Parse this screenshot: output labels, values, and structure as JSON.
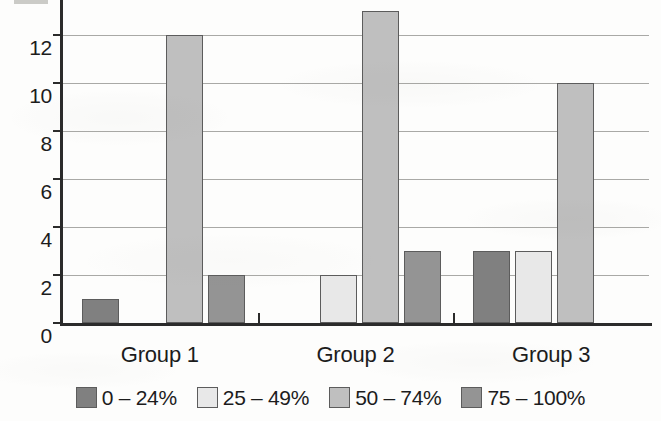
{
  "chart_data": {
    "type": "bar",
    "title": "",
    "subtitle": "",
    "xlabel": "",
    "ylabel": "",
    "categories": [
      "Group 1",
      "Group 2",
      "Group 3"
    ],
    "series": [
      {
        "name": "0 – 24%",
        "values": [
          1,
          0,
          3
        ],
        "color": "#808080"
      },
      {
        "name": "25 – 49%",
        "values": [
          0,
          2,
          3
        ],
        "color": "#e8e8e8"
      },
      {
        "name": "50 – 74%",
        "values": [
          12,
          13,
          10
        ],
        "color": "#bfbfbf"
      },
      {
        "name": "75 – 100%",
        "values": [
          2,
          3,
          0
        ],
        "color": "#949494"
      }
    ],
    "ylim": [
      0,
      14
    ],
    "ytick_values": [
      0,
      2,
      4,
      6,
      8,
      10,
      12,
      14
    ],
    "ytick_labels": [
      "0",
      "2",
      "4",
      "6",
      "8",
      "10",
      "12",
      "14"
    ],
    "ytick_labels_visible": [
      "0",
      "2",
      "4",
      "6",
      "8",
      "10",
      "12"
    ],
    "grid": true,
    "grid_axis": "y",
    "legend_position": "bottom",
    "bar_orientation": "vertical",
    "note_top_cropped": true
  },
  "axis": {
    "y_axis_name": "y-axis",
    "x_axis_name": "x-axis",
    "grid_color": "#9a9a96",
    "axis_color": "#2b2b2b"
  },
  "legend": {
    "items": [
      {
        "label": "0 – 24%",
        "color": "#808080"
      },
      {
        "label": "25 – 49%",
        "color": "#e8e8e8"
      },
      {
        "label": "50 – 74%",
        "color": "#bfbfbf"
      },
      {
        "label": "75 – 100%",
        "color": "#949494"
      }
    ]
  }
}
